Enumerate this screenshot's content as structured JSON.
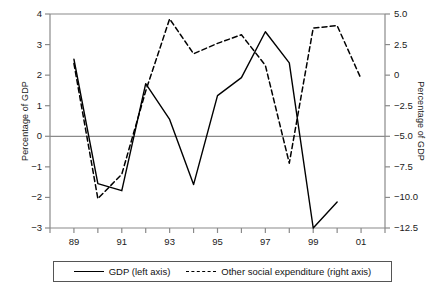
{
  "chart_data": {
    "type": "line",
    "title": "",
    "xlabel": "",
    "ylabel": "Percentage of GDP",
    "y2label": "Percentage of GDP",
    "grid": false,
    "legend_position": "bottom",
    "x": [
      89,
      90,
      91,
      92,
      93,
      94,
      95,
      96,
      97,
      98,
      99,
      100,
      101
    ],
    "x_tick_labels": [
      "89",
      "91",
      "93",
      "95",
      "97",
      "99",
      "01"
    ],
    "x_tick_values": [
      89,
      91,
      93,
      95,
      97,
      99,
      101
    ],
    "x_minor_tick_values": [
      88,
      90,
      92,
      94,
      96,
      98,
      100,
      102
    ],
    "xlim": [
      88,
      102
    ],
    "ylim": [
      -3,
      4
    ],
    "y_tick_labels": [
      "4",
      "3",
      "2",
      "1",
      "0",
      "−1",
      "−2",
      "−3"
    ],
    "y_tick_values": [
      4,
      3,
      2,
      1,
      0,
      -1,
      -2,
      -3
    ],
    "y2lim": [
      -12.5,
      5.0
    ],
    "y2_tick_labels": [
      "5.0",
      "2.5",
      "0",
      "−2.5",
      "−5.0",
      "−7.5",
      "−10.0",
      "−12.5"
    ],
    "y2_tick_values": [
      5.0,
      2.5,
      0,
      -2.5,
      -5.0,
      -7.5,
      -10.0,
      -12.5
    ],
    "zero_line_left_value": 0,
    "series": [
      {
        "name": "GDP (left axis)",
        "axis": "left",
        "style": "solid",
        "color": "#000000",
        "x": [
          89,
          90,
          91,
          92,
          93,
          94,
          95,
          96,
          97,
          98,
          99,
          100
        ],
        "values": [
          2.52,
          -1.55,
          -1.78,
          1.72,
          0.55,
          -1.58,
          1.33,
          1.92,
          3.42,
          2.4,
          -3.0,
          -2.15
        ]
      },
      {
        "name": "Other social expenditure (right axis)",
        "axis": "right",
        "style": "dashed",
        "color": "#000000",
        "x": [
          89,
          90,
          91,
          92,
          93,
          94,
          95,
          96,
          97,
          98,
          99,
          100,
          101
        ],
        "values": [
          0.95,
          -10.1,
          -8.1,
          -1.3,
          4.6,
          1.75,
          2.6,
          3.3,
          0.8,
          -7.2,
          3.85,
          4.05,
          -0.3
        ]
      }
    ]
  },
  "legend": {
    "items": [
      {
        "label": "GDP (left axis)",
        "style": "solid"
      },
      {
        "label": "Other social expenditure (right axis)",
        "style": "dashed"
      }
    ]
  }
}
